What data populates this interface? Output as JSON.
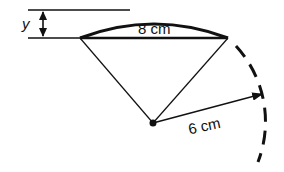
{
  "diagram": {
    "type": "circle-segment",
    "labels": {
      "chord": "8 cm",
      "radius": "6 cm",
      "height": "y"
    },
    "colors": {
      "stroke": "#111111",
      "background": "#ffffff"
    }
  }
}
